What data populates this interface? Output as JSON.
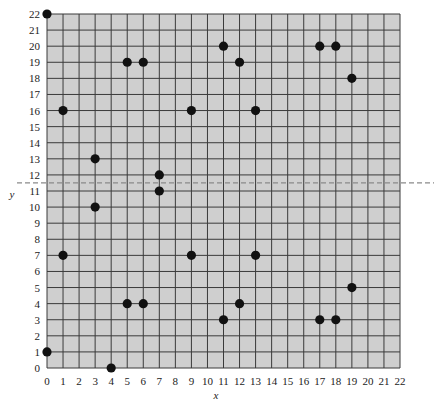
{
  "chart_data": {
    "type": "scatter",
    "title": "",
    "xlabel": "x",
    "ylabel": "y",
    "xlim": [
      0,
      22
    ],
    "ylim": [
      0,
      22
    ],
    "grid": true,
    "x_ticks": [
      0,
      1,
      2,
      3,
      4,
      5,
      6,
      7,
      8,
      9,
      10,
      11,
      12,
      13,
      14,
      15,
      16,
      17,
      18,
      19,
      20,
      21,
      22
    ],
    "y_ticks": [
      0,
      1,
      2,
      3,
      4,
      5,
      6,
      7,
      8,
      9,
      10,
      11,
      12,
      13,
      14,
      15,
      16,
      17,
      18,
      19,
      20,
      21,
      22
    ],
    "points": [
      {
        "x": 0,
        "y": 22
      },
      {
        "x": 0,
        "y": 1
      },
      {
        "x": 1,
        "y": 16
      },
      {
        "x": 1,
        "y": 7
      },
      {
        "x": 3,
        "y": 13
      },
      {
        "x": 3,
        "y": 10
      },
      {
        "x": 4,
        "y": 0
      },
      {
        "x": 5,
        "y": 19
      },
      {
        "x": 6,
        "y": 19
      },
      {
        "x": 5,
        "y": 4
      },
      {
        "x": 6,
        "y": 4
      },
      {
        "x": 7,
        "y": 12
      },
      {
        "x": 7,
        "y": 11
      },
      {
        "x": 9,
        "y": 16
      },
      {
        "x": 9,
        "y": 7
      },
      {
        "x": 11,
        "y": 20
      },
      {
        "x": 11,
        "y": 3
      },
      {
        "x": 12,
        "y": 19
      },
      {
        "x": 12,
        "y": 4
      },
      {
        "x": 13,
        "y": 16
      },
      {
        "x": 13,
        "y": 7
      },
      {
        "x": 17,
        "y": 20
      },
      {
        "x": 18,
        "y": 20
      },
      {
        "x": 19,
        "y": 18
      },
      {
        "x": 19,
        "y": 5
      },
      {
        "x": 17,
        "y": 3
      },
      {
        "x": 18,
        "y": 3
      }
    ],
    "annotations": [
      {
        "type": "horizontal-dashed-line",
        "y": 11.5
      }
    ],
    "legend": null
  },
  "colors": {
    "plot_background": "#cfcfcf",
    "grid_line": "#3a3a3a",
    "point": "#111111",
    "dashed_line": "#8a8a8a",
    "text": "#222222"
  }
}
